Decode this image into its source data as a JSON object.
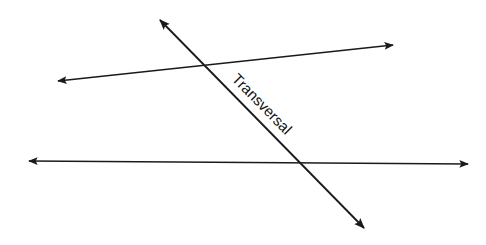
{
  "diagram": {
    "label": "Transversal",
    "colors": {
      "line": "#1a1a1a",
      "background": "#ffffff"
    },
    "lines": [
      {
        "name": "upper-line",
        "x1": 58,
        "y1": 81,
        "x2": 393,
        "y2": 45
      },
      {
        "name": "lower-line",
        "x1": 29,
        "y1": 161,
        "x2": 468,
        "y2": 164
      },
      {
        "name": "transversal-line",
        "x1": 160,
        "y1": 20,
        "x2": 364,
        "y2": 228
      }
    ]
  }
}
